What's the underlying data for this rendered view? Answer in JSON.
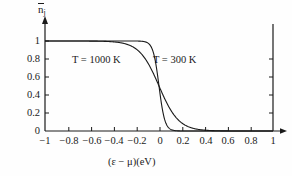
{
  "chart_data": {
    "type": "line",
    "title": "",
    "subtitle": "",
    "xlabel": "(ε − μ)(eV)",
    "ylabel": "n̄j",
    "ylabel_base": "n",
    "ylabel_sub": "j",
    "xlim": [
      -1,
      1
    ],
    "ylim": [
      0,
      1
    ],
    "grid": false,
    "legend_position": "inline-annotation",
    "xticks": [
      -1,
      -0.8,
      -0.6,
      -0.4,
      -0.2,
      0,
      0.2,
      0.4,
      0.6,
      0.8,
      1
    ],
    "xtick_labels": [
      "−1",
      "−0.8",
      "−0.6",
      "−0.4",
      "−0.2",
      "0",
      "0.2",
      "0.4",
      "0.6",
      "0.8",
      "1"
    ],
    "yticks": [
      0,
      0.2,
      0.4,
      0.6,
      0.8,
      1
    ],
    "ytick_labels": [
      "0",
      "0.2",
      "0.4",
      "0.6",
      "0.8",
      "1"
    ],
    "series": [
      {
        "name": "T = 300 K",
        "kT_eV": 0.02585,
        "x": [
          -1,
          -0.3,
          -0.25,
          -0.2,
          -0.18,
          -0.16,
          -0.14,
          -0.12,
          -0.1,
          -0.09,
          -0.08,
          -0.07,
          -0.06,
          -0.05,
          -0.04,
          -0.03,
          -0.02,
          -0.01,
          0,
          0.01,
          0.02,
          0.03,
          0.04,
          0.05,
          0.06,
          0.07,
          0.08,
          0.09,
          0.1,
          0.12,
          0.14,
          0.16,
          0.18,
          0.2,
          0.25,
          0.3,
          0.5,
          1
        ],
        "values": [
          1,
          1,
          1,
          0.9996,
          0.9991,
          0.998,
          0.9955,
          0.99,
          0.9794,
          0.9704,
          0.9569,
          0.9374,
          0.9099,
          0.8727,
          0.8246,
          0.766,
          0.6997,
          0.6299,
          0.5,
          0.4,
          0.3,
          0.234,
          0.1754,
          0.1273,
          0.0901,
          0.0626,
          0.0431,
          0.0296,
          0.0206,
          0.0104,
          0.0045,
          0.002,
          0.0009,
          0.0004,
          0.0001,
          0,
          0,
          0
        ]
      },
      {
        "name": "T = 1000 K",
        "kT_eV": 0.08617,
        "x": [
          -1,
          -0.6,
          -0.5,
          -0.45,
          -0.4,
          -0.35,
          -0.3,
          -0.25,
          -0.2,
          -0.15,
          -0.1,
          -0.05,
          0,
          0.05,
          0.1,
          0.15,
          0.2,
          0.25,
          0.3,
          0.35,
          0.4,
          0.45,
          0.5,
          0.6,
          0.7,
          0.8,
          0.9,
          1
        ],
        "values": [
          1,
          0.999,
          0.997,
          0.995,
          0.99,
          0.983,
          0.97,
          0.948,
          0.913,
          0.852,
          0.762,
          0.642,
          0.5,
          0.358,
          0.238,
          0.148,
          0.087,
          0.052,
          0.03,
          0.017,
          0.0099,
          0.0055,
          0.0032,
          0.001,
          0.0003,
          0.0001,
          4e-05,
          1e-05
        ]
      }
    ],
    "annotations": [
      {
        "text": "T = 1000 K",
        "x": -0.38,
        "y": 0.82
      },
      {
        "text": "T = 300 K",
        "x": 0.07,
        "y": 0.82
      }
    ],
    "axis_style": {
      "y_axis_arrow": true,
      "x_axis_arrow": true,
      "right_axis": true,
      "top_line": true,
      "line_color": "#1a1a1a"
    }
  }
}
